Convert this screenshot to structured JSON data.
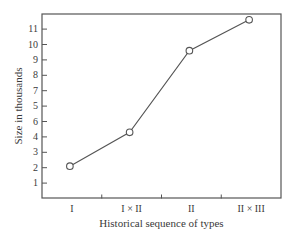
{
  "chart_data": {
    "type": "line",
    "title": "",
    "xlabel": "Historical sequence of types",
    "ylabel": "Size in thousands",
    "categories": [
      "I",
      "I × II",
      "II",
      "II × III"
    ],
    "values": [
      2.1,
      4.3,
      9.6,
      11.6
    ],
    "ylim": [
      0,
      12
    ],
    "y_tick_labels": [
      "1",
      "2",
      "3",
      "4",
      "6",
      "5",
      "7",
      "8",
      "9",
      "10",
      "11"
    ],
    "grid": false,
    "legend": null,
    "marker": "open-circle"
  }
}
